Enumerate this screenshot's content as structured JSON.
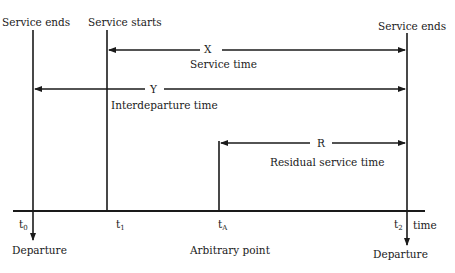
{
  "diagram": {
    "top_labels": {
      "left": "Service ends",
      "start": "Service starts",
      "right": "Service ends"
    },
    "arrows": {
      "x": {
        "symbol": "X",
        "caption": "Service time"
      },
      "y": {
        "symbol": "Y",
        "caption": "Interdeparture time"
      },
      "r": {
        "symbol": "R",
        "caption": "Residual service time"
      }
    },
    "axis": {
      "label": "time",
      "ticks": [
        {
          "base": "t",
          "sub": "0"
        },
        {
          "base": "t",
          "sub": "1"
        },
        {
          "base": "t",
          "sub": "A"
        },
        {
          "base": "t",
          "sub": "2"
        }
      ]
    },
    "bottom_labels": {
      "left": "Departure",
      "middle": "Arbitrary point",
      "right": "Departure"
    },
    "colors": {
      "ink": "#1a1a1a",
      "background": "#ffffff"
    }
  }
}
